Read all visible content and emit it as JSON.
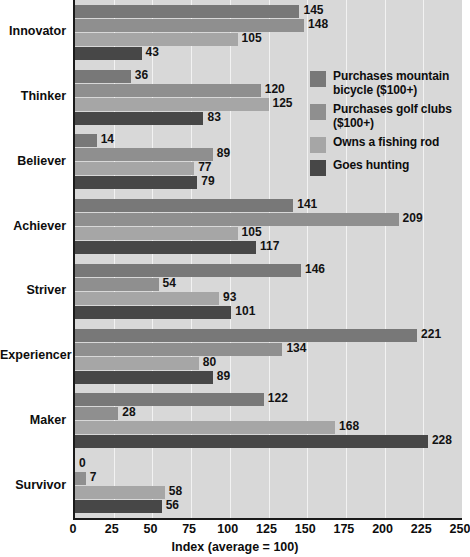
{
  "chart_data": {
    "type": "bar",
    "orientation": "horizontal",
    "title": "",
    "xlabel": "Index (average = 100)",
    "ylabel": "",
    "xlim": [
      0,
      250
    ],
    "xticks": [
      0,
      25,
      50,
      75,
      100,
      125,
      150,
      175,
      200,
      225,
      250
    ],
    "grid": true,
    "legend_position": "inside-right-upper",
    "categories": [
      "Innovator",
      "Thinker",
      "Believer",
      "Achiever",
      "Striver",
      "Experiencer",
      "Maker",
      "Survivor"
    ],
    "series": [
      {
        "name": "Purchases mountain bicycle ($100+)",
        "color": "#787878",
        "values": [
          145,
          36,
          14,
          141,
          146,
          221,
          122,
          0
        ]
      },
      {
        "name": "Purchases golf clubs ($100+)",
        "color": "#8f8f8f",
        "values": [
          148,
          120,
          89,
          209,
          54,
          134,
          28,
          7
        ]
      },
      {
        "name": "Owns a fishing rod",
        "color": "#a6a6a6",
        "values": [
          105,
          125,
          77,
          105,
          93,
          80,
          168,
          58
        ]
      },
      {
        "name": "Goes hunting",
        "color": "#474747",
        "values": [
          43,
          83,
          79,
          117,
          101,
          89,
          228,
          56
        ]
      }
    ]
  },
  "legend": {
    "items": [
      {
        "label": "Purchases mountain bicycle ($100+)",
        "color": "#787878"
      },
      {
        "label": "Purchases golf clubs ($100+)",
        "color": "#8f8f8f"
      },
      {
        "label": "Owns a fishing rod",
        "color": "#a6a6a6"
      },
      {
        "label": "Goes hunting",
        "color": "#474747"
      }
    ]
  },
  "axis": {
    "x_label": "Index (average = 100)",
    "x_ticks": [
      "0",
      "25",
      "50",
      "75",
      "100",
      "125",
      "150",
      "175",
      "200",
      "225",
      "250"
    ]
  },
  "colors": {
    "plot_background": "#d8d8d8",
    "gridline": "#f2f2f2",
    "axis": "#1a1a1a",
    "text": "#0d0d0d"
  }
}
